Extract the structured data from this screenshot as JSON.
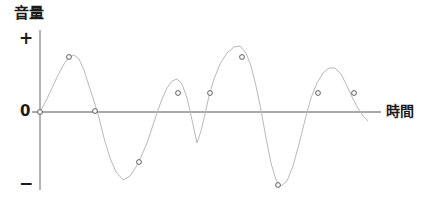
{
  "chart_data": {
    "type": "line",
    "title": "",
    "ylabel": "音量",
    "xlabel": "時間",
    "y_tick_labels": [
      "+",
      "0",
      "−"
    ],
    "grid": false,
    "legend": null,
    "axis_color": "#8c8c8c",
    "curve_color": "#b9b9b9",
    "marker_edge_color": "#4d4d4d",
    "marker_fill_color": "#ffffff",
    "label_color": "#1a1a1a",
    "xlim": [
      40,
      381
    ],
    "ylim": [
      30,
      190
    ],
    "baseline_y": 112,
    "origin_x": 40,
    "curve_points": [
      [
        40,
        112
      ],
      [
        46,
        101
      ],
      [
        52,
        88
      ],
      [
        58,
        75
      ],
      [
        64,
        64
      ],
      [
        69,
        57
      ],
      [
        74,
        55
      ],
      [
        79,
        59
      ],
      [
        84,
        70
      ],
      [
        89,
        86
      ],
      [
        95,
        104
      ],
      [
        99,
        118
      ],
      [
        104,
        138
      ],
      [
        110,
        158
      ],
      [
        116,
        172
      ],
      [
        123,
        180
      ],
      [
        130,
        176
      ],
      [
        136,
        167
      ],
      [
        141,
        157
      ],
      [
        147,
        143
      ],
      [
        152,
        128
      ],
      [
        157,
        113
      ],
      [
        162,
        99
      ],
      [
        167,
        88
      ],
      [
        172,
        81
      ],
      [
        177,
        79
      ],
      [
        182,
        84
      ],
      [
        187,
        98
      ],
      [
        192,
        120
      ],
      [
        197,
        143
      ],
      [
        201,
        131
      ],
      [
        205,
        114
      ],
      [
        209,
        96
      ],
      [
        214,
        79
      ],
      [
        220,
        64
      ],
      [
        227,
        53
      ],
      [
        234,
        47
      ],
      [
        240,
        46
      ],
      [
        246,
        53
      ],
      [
        251,
        66
      ],
      [
        256,
        86
      ],
      [
        261,
        110
      ],
      [
        266,
        138
      ],
      [
        271,
        163
      ],
      [
        276,
        180
      ],
      [
        281,
        186
      ],
      [
        287,
        181
      ],
      [
        293,
        166
      ],
      [
        299,
        144
      ],
      [
        305,
        120
      ],
      [
        311,
        98
      ],
      [
        317,
        83
      ],
      [
        323,
        73
      ],
      [
        329,
        68
      ],
      [
        335,
        68
      ],
      [
        341,
        74
      ],
      [
        347,
        86
      ],
      [
        353,
        99
      ],
      [
        359,
        110
      ],
      [
        364,
        117
      ],
      [
        368,
        121
      ]
    ],
    "markers": [
      {
        "x": 40,
        "y": 112,
        "label": "origin"
      },
      {
        "x": 69,
        "y": 57,
        "label": "peak-1"
      },
      {
        "x": 95,
        "y": 111,
        "label": "zero-crossing-1"
      },
      {
        "x": 139,
        "y": 162,
        "label": "trough-1-rise"
      },
      {
        "x": 178,
        "y": 93,
        "label": "peak-2"
      },
      {
        "x": 210,
        "y": 93,
        "label": "rise-2"
      },
      {
        "x": 242,
        "y": 57,
        "label": "peak-3"
      },
      {
        "x": 278,
        "y": 185,
        "label": "trough-2"
      },
      {
        "x": 318,
        "y": 93,
        "label": "rise-3"
      },
      {
        "x": 354,
        "y": 93,
        "label": "fall-3"
      }
    ],
    "vertical_axis": {
      "x": 40,
      "y_top": 30,
      "y_bottom": 190
    },
    "horizontal_axis": {
      "y": 112,
      "x_left": 32,
      "x_right": 381
    }
  }
}
